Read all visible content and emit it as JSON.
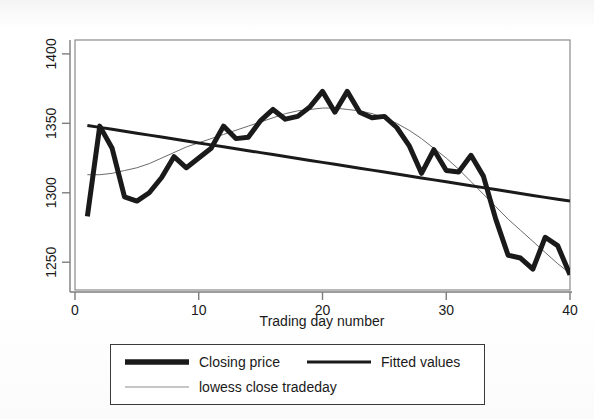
{
  "chart_data": {
    "type": "line",
    "title": "",
    "xlabel": "Trading day number",
    "ylabel": "",
    "xlim": [
      0,
      40
    ],
    "ylim": [
      1230,
      1410
    ],
    "xticks": [
      0,
      10,
      20,
      30,
      40
    ],
    "xticklabels": [
      "0",
      "10",
      "20",
      "30",
      "40"
    ],
    "yticks": [
      1250,
      1300,
      1350,
      1400
    ],
    "yticklabels": [
      "1250",
      "1300",
      "1350",
      "1400"
    ],
    "grid": false,
    "legend_position": "below",
    "x": [
      1,
      2,
      3,
      4,
      5,
      6,
      7,
      8,
      9,
      10,
      11,
      12,
      13,
      14,
      15,
      16,
      17,
      18,
      19,
      20,
      21,
      22,
      23,
      24,
      25,
      26,
      27,
      28,
      29,
      30,
      31,
      32,
      33,
      34,
      35,
      36,
      37,
      38,
      39,
      40
    ],
    "series": [
      {
        "name": "Closing price",
        "style": "thick-solid",
        "color": "#1a1a1a",
        "width": 5,
        "values": [
          1283,
          1348,
          1332,
          1297,
          1294,
          1300,
          1311,
          1326,
          1318,
          1325,
          1332,
          1348,
          1339,
          1340,
          1352,
          1360,
          1353,
          1355,
          1362,
          1373,
          1358,
          1373,
          1358,
          1354,
          1355,
          1347,
          1334,
          1314,
          1331,
          1316,
          1315,
          1327,
          1312,
          1281,
          1255,
          1253,
          1245,
          1268,
          1262,
          1241
        ]
      },
      {
        "name": "Fitted values",
        "style": "medium-solid",
        "color": "#1a1a1a",
        "width": 3,
        "values": [
          1348.5,
          1347.1,
          1345.7,
          1344.3,
          1342.9,
          1341.5,
          1340.1,
          1338.7,
          1337.3,
          1335.9,
          1334.5,
          1333.1,
          1331.7,
          1330.3,
          1328.9,
          1327.5,
          1326.1,
          1324.7,
          1323.3,
          1321.9,
          1320.5,
          1319.1,
          1317.7,
          1316.3,
          1314.9,
          1313.5,
          1312.1,
          1310.7,
          1309.3,
          1307.9,
          1306.5,
          1305.1,
          1303.7,
          1302.3,
          1300.9,
          1299.5,
          1298.1,
          1296.7,
          1295.3,
          1294.0
        ]
      },
      {
        "name": "lowess close tradeday",
        "style": "thin-solid",
        "color": "#6b6b6b",
        "width": 1,
        "values": [
          1313,
          1313,
          1314,
          1316,
          1318,
          1321,
          1325,
          1329,
          1333,
          1336,
          1339,
          1342,
          1345,
          1348,
          1351,
          1354,
          1357,
          1359,
          1360,
          1361,
          1361,
          1360,
          1359,
          1357,
          1354,
          1350,
          1345,
          1339,
          1332,
          1325,
          1317,
          1308,
          1299,
          1290,
          1281,
          1273,
          1265,
          1257,
          1249,
          1242
        ]
      }
    ]
  },
  "legend": {
    "entries": [
      {
        "label": "Closing price",
        "style": "thick-solid"
      },
      {
        "label": "Fitted values",
        "style": "medium-solid"
      },
      {
        "label": "lowess close tradeday",
        "style": "thin-solid"
      }
    ]
  },
  "axis": {
    "x_title": "Trading day number",
    "x_tick_0": "0",
    "x_tick_1": "10",
    "x_tick_2": "20",
    "x_tick_3": "30",
    "x_tick_4": "40",
    "y_tick_0": "1250",
    "y_tick_1": "1300",
    "y_tick_2": "1350",
    "y_tick_3": "1400"
  }
}
